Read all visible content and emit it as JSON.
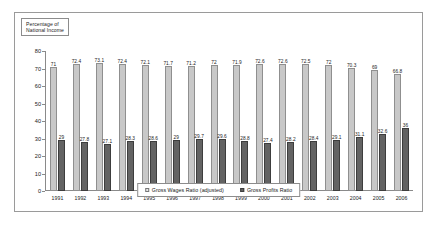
{
  "title_box": {
    "line1": "Percentage of",
    "line2": "National Income"
  },
  "legend": {
    "entries": [
      {
        "label": "Gross Wages Ratio (adjusted)",
        "color": "#e8e8e8",
        "swatch": "wages"
      },
      {
        "label": "Gross Profits Ratio",
        "color": "#636363",
        "swatch": "profits"
      }
    ]
  },
  "chart_data": {
    "type": "bar",
    "title": "Percentage of National Income",
    "xlabel": "",
    "ylabel": "Percentage of National Income",
    "ylim": [
      0,
      80
    ],
    "yticks": [
      0,
      10,
      20,
      30,
      40,
      50,
      60,
      70,
      80
    ],
    "grid": false,
    "legend_position": "bottom-center",
    "categories": [
      "1991",
      "1992",
      "1993",
      "1994",
      "1995",
      "1996",
      "1997",
      "1998",
      "1999",
      "2000",
      "2001",
      "2002",
      "2003",
      "2004",
      "2005",
      "2006"
    ],
    "series": [
      {
        "name": "Gross Wages Ratio (adjusted)",
        "color": "#c8c8c8",
        "values": [
          71,
          72.4,
          73.1,
          72.4,
          72.1,
          71.7,
          71.2,
          72,
          71.9,
          72.6,
          72.6,
          72.5,
          72,
          70.3,
          69,
          66.8
        ],
        "labels": [
          "71",
          "72.4",
          "73.1",
          "72.4",
          "72.1",
          "71.7",
          "71.2",
          "72",
          "71.9",
          "72.6",
          "72.6",
          "72.5",
          "72",
          "70.3",
          "69",
          "66.8"
        ]
      },
      {
        "name": "Gross Profits Ratio",
        "color": "#636363",
        "values": [
          29,
          27.8,
          27.1,
          28.3,
          28.6,
          29,
          29.7,
          29.6,
          28.8,
          27.4,
          28.2,
          28.4,
          29.1,
          31.1,
          32.6,
          36
        ],
        "labels": [
          "29",
          "27.8",
          "27.1",
          "28.3",
          "28.6",
          "29",
          "29.7",
          "29.6",
          "28.8",
          "27.4",
          "28.2",
          "28.4",
          "29.1",
          "31.1",
          "32.6",
          "36"
        ]
      }
    ]
  }
}
